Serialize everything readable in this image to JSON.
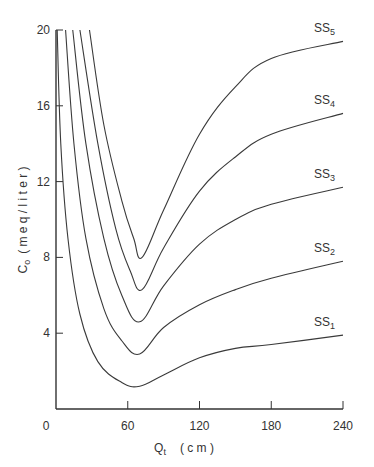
{
  "chart_data": {
    "type": "line",
    "title": "",
    "xlabel": "Q_t (cm)",
    "xlabel_main": "Q",
    "xlabel_sub": "t",
    "xlabel_unit": "( c m )",
    "ylabel": "C_o (meq / liter)",
    "ylabel_main": "C",
    "ylabel_sub": "o",
    "ylabel_unit": "( m e q  /  l i t e r )",
    "xlim": [
      0,
      240
    ],
    "ylim": [
      0,
      20
    ],
    "xticks": [
      0,
      60,
      120,
      180,
      240
    ],
    "xtick_labels": [
      "0",
      "60",
      "120",
      "180",
      "240"
    ],
    "yticks": [
      4,
      8,
      12,
      16,
      20
    ],
    "ytick_labels": [
      "4",
      "8",
      "12",
      "16",
      "20"
    ],
    "grid": false,
    "legend": "inline labels at right end of each curve",
    "series": [
      {
        "name": "SS5",
        "label_main": "SS",
        "label_sub": "5",
        "x": [
          28,
          40,
          55,
          65,
          72,
          90,
          120,
          150,
          180,
          240
        ],
        "y": [
          20,
          15,
          11,
          9,
          8,
          10.5,
          14.5,
          17,
          18.5,
          19.4
        ]
      },
      {
        "name": "SS4",
        "label_main": "SS",
        "label_sub": "4",
        "x": [
          20,
          35,
          50,
          62,
          72,
          90,
          120,
          150,
          180,
          240
        ],
        "y": [
          20,
          14,
          9.5,
          7.3,
          6.3,
          8.5,
          11.5,
          13.3,
          14.5,
          15.6
        ]
      },
      {
        "name": "SS3",
        "label_main": "SS",
        "label_sub": "3",
        "x": [
          14,
          25,
          40,
          55,
          70,
          90,
          120,
          150,
          180,
          240
        ],
        "y": [
          20,
          14,
          9,
          6,
          4.6,
          6.5,
          8.7,
          10,
          10.8,
          11.7
        ]
      },
      {
        "name": "SS2",
        "label_main": "SS",
        "label_sub": "2",
        "x": [
          8,
          15,
          25,
          40,
          55,
          70,
          90,
          120,
          150,
          180,
          240
        ],
        "y": [
          20,
          14,
          9,
          5.3,
          3.6,
          2.9,
          4.3,
          5.5,
          6.3,
          6.9,
          7.8
        ]
      },
      {
        "name": "SS1",
        "label_main": "SS",
        "label_sub": "1",
        "x": [
          1,
          4,
          10,
          20,
          35,
          55,
          70,
          90,
          120,
          150,
          180,
          240
        ],
        "y": [
          20,
          14,
          9,
          5,
          2.5,
          1.4,
          1.2,
          1.8,
          2.7,
          3.2,
          3.4,
          3.9
        ]
      }
    ]
  },
  "colors": {
    "line": "#3a3a3a",
    "axis": "#333333",
    "background": "#ffffff"
  }
}
